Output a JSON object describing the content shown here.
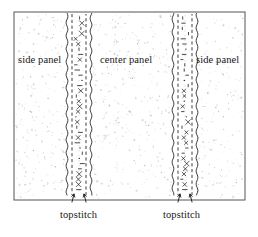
{
  "figure": {
    "kind": "sewing-pattern-diagram",
    "title_visible": false,
    "background_color": "#ffffff",
    "ink_color": "#1a1a1a",
    "frame": {
      "x": 14,
      "y": 12,
      "width": 231,
      "height": 188,
      "stroke": "#555555"
    },
    "texture": {
      "name": "stipple-fabric-texture",
      "description": "random fine speckles representing fabric",
      "dot_color": "#8a8a8a",
      "density": 900
    }
  },
  "labels": {
    "side_panel_left": "side panel",
    "center_panel": "center panel",
    "side_panel_right": "side panel",
    "topstitch_left": "topstitch",
    "topstitch_right": "topstitch"
  },
  "seams": [
    {
      "name": "left-seam",
      "center_x": 79,
      "outer_left_x": 67,
      "outer_right_x": 91,
      "stitch_left_x": 72,
      "stitch_right_x": 86,
      "top_y": 13,
      "bottom_y": 196,
      "topstitch_label": "topstitch",
      "arrows": [
        {
          "from_x": 72,
          "from_y": 202,
          "to_x": 74,
          "to_y": 194
        },
        {
          "from_x": 86,
          "from_y": 202,
          "to_x": 84,
          "to_y": 194
        }
      ]
    },
    {
      "name": "right-seam",
      "center_x": 185,
      "outer_left_x": 173,
      "outer_right_x": 197,
      "stitch_left_x": 178,
      "stitch_right_x": 192,
      "top_y": 13,
      "bottom_y": 196,
      "topstitch_label": "topstitch",
      "arrows": [
        {
          "from_x": 178,
          "from_y": 202,
          "to_x": 180,
          "to_y": 194
        },
        {
          "from_x": 192,
          "from_y": 202,
          "to_x": 190,
          "to_y": 194
        }
      ]
    }
  ],
  "panels": [
    {
      "name": "side-panel-left",
      "label": "side panel",
      "x_range": [
        14,
        67
      ]
    },
    {
      "name": "center-panel",
      "label": "center panel",
      "x_range": [
        91,
        173
      ]
    },
    {
      "name": "side-panel-right",
      "label": "side panel",
      "x_range": [
        197,
        245
      ]
    }
  ]
}
